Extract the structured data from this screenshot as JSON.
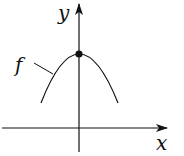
{
  "diagram": {
    "type": "function-graph",
    "axes": {
      "x_label": "x",
      "y_label": "y"
    },
    "curve": {
      "label": "f",
      "shape": "downward parabola",
      "vertex": "on y-axis, marked with dot"
    },
    "colors": {
      "stroke": "#111111",
      "background": "#ffffff"
    }
  }
}
